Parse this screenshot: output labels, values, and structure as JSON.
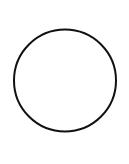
{
  "canvas": {
    "width": 129,
    "height": 164,
    "background": "#ffffff"
  },
  "shape": {
    "type": "circle",
    "cx": 65,
    "cy": 80.5,
    "r": 51,
    "stroke": "#111111",
    "stroke_width": 2,
    "fill": "none"
  }
}
